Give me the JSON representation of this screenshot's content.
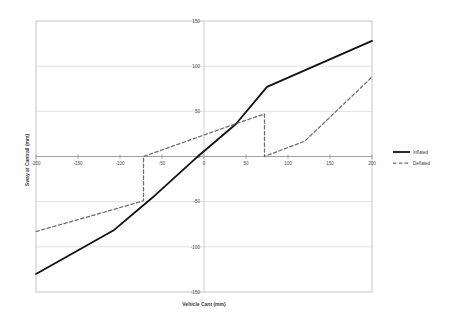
{
  "chart_data": {
    "type": "line",
    "title": "",
    "xlabel": "Vehicle Cant (mm)",
    "ylabel": "Sway at Cantrail (mm)",
    "xlim": [
      -200,
      200
    ],
    "ylim": [
      -150,
      150
    ],
    "xticks": [
      -200,
      -150,
      -100,
      -50,
      0,
      50,
      100,
      150,
      200
    ],
    "yticks": [
      -150,
      -100,
      -50,
      0,
      50,
      100,
      150
    ],
    "xtick_labels": [
      "-200",
      "-150",
      "-100",
      "-50",
      "0",
      "50",
      "100",
      "150",
      "200"
    ],
    "ytick_labels": [
      "-150",
      "-100",
      "-50",
      "0",
      "50",
      "100",
      "150"
    ],
    "grid": true,
    "grid_axis": "y",
    "legend_position": "right",
    "series": [
      {
        "name": "Inflated",
        "style": "solid",
        "color": "#111111",
        "points": [
          [
            -200,
            -130
          ],
          [
            -108,
            -82
          ],
          [
            -62,
            -46
          ],
          [
            -5,
            2
          ],
          [
            38,
            36
          ],
          [
            75,
            77
          ],
          [
            200,
            128
          ]
        ]
      },
      {
        "name": "Deflated",
        "style": "dashed",
        "color": "#6b6b6b",
        "points": [
          [
            -200,
            -83
          ],
          [
            -120,
            -62
          ],
          [
            -72,
            -49
          ],
          [
            -72,
            0
          ],
          [
            40,
            37
          ],
          [
            72,
            47
          ],
          [
            72,
            0
          ],
          [
            120,
            17
          ],
          [
            200,
            88
          ]
        ]
      }
    ]
  },
  "legend": {
    "items": [
      {
        "label": "Inflated",
        "style": "solid"
      },
      {
        "label": "Deflated",
        "style": "dashed"
      }
    ]
  }
}
